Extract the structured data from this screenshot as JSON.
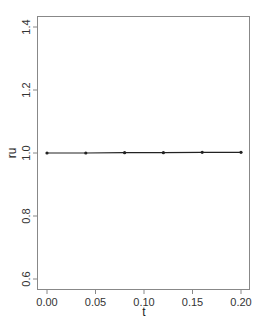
{
  "chart_data": {
    "type": "line",
    "title": "",
    "xlabel": "t",
    "ylabel": "ru",
    "xlim": [
      0.0,
      0.2
    ],
    "ylim": [
      0.6,
      1.4
    ],
    "x_ticks": [
      "0.00",
      "0.05",
      "0.10",
      "0.15",
      "0.20"
    ],
    "y_ticks": [
      "0.6",
      "0.8",
      "1.0",
      "1.2",
      "1.4"
    ],
    "grid": false,
    "legend": null,
    "series": [
      {
        "name": "ru",
        "x": [
          0.0,
          0.04,
          0.08,
          0.12,
          0.16,
          0.2
        ],
        "values": [
          1.0,
          1.0,
          1.001,
          1.001,
          1.002,
          1.002
        ],
        "marker": "dot",
        "color": "#222222"
      }
    ]
  },
  "axes": {
    "xlabel": "t",
    "ylabel": "ru",
    "x_ticks": [
      {
        "label": "0.00",
        "value": 0.0
      },
      {
        "label": "0.05",
        "value": 0.05
      },
      {
        "label": "0.10",
        "value": 0.1
      },
      {
        "label": "0.15",
        "value": 0.15
      },
      {
        "label": "0.20",
        "value": 0.2
      }
    ],
    "y_ticks": [
      {
        "label": "0.6",
        "value": 0.6
      },
      {
        "label": "0.8",
        "value": 0.8
      },
      {
        "label": "1.0",
        "value": 1.0
      },
      {
        "label": "1.2",
        "value": 1.2
      },
      {
        "label": "1.4",
        "value": 1.4
      }
    ]
  },
  "colors": {
    "frame": "#888888",
    "line": "#222222",
    "text": "#333333"
  }
}
